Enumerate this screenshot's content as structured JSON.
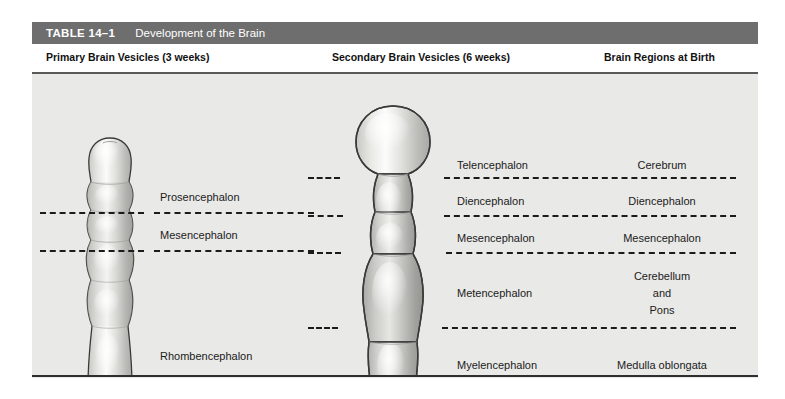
{
  "table": {
    "number": "TABLE 14–1",
    "title": "Development of the Brain"
  },
  "columns": [
    {
      "id": "primary",
      "label": "Primary Brain Vesicles (3 weeks)"
    },
    {
      "id": "secondary",
      "label": "Secondary Brain Vesicles (6 weeks)"
    },
    {
      "id": "birth",
      "label": "Brain Regions at Birth"
    }
  ],
  "primary_vesicles": [
    {
      "label": "Prosencephalon"
    },
    {
      "label": "Mesencephalon"
    },
    {
      "label": "Rhombencephalon"
    }
  ],
  "secondary_vesicles": [
    {
      "label": "Telencephalon"
    },
    {
      "label": "Diencephalon"
    },
    {
      "label": "Mesencephalon"
    },
    {
      "label": "Metencephalon"
    },
    {
      "label": "Myelencephalon"
    }
  ],
  "brain_regions_at_birth": [
    {
      "label": "Cerebrum"
    },
    {
      "label": "Diencephalon"
    },
    {
      "label": "Mesencephalon"
    },
    {
      "label_line1": "Cerebellum",
      "label_line2": "and",
      "label_line3": "Pons"
    },
    {
      "label": "Medulla oblongata"
    }
  ],
  "figures": [
    {
      "name": "primary-brain-vesicle-diagram"
    },
    {
      "name": "secondary-brain-vesicle-diagram"
    }
  ],
  "colors": {
    "title_bar": "#6e6e6e",
    "plate_background": "#e9e9e7",
    "rule": "#5a5a5a",
    "text": "#1b1b1b",
    "title_text": "#ffffff",
    "figure_fill_light": "#f2f2f0",
    "figure_fill_mid": "#c9c9c6",
    "figure_outline": "#3a3a3a"
  }
}
